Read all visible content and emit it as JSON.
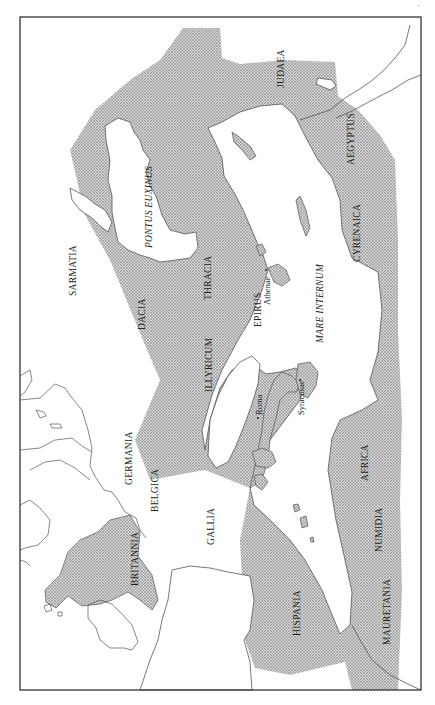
{
  "map": {
    "title": "",
    "orientation": "rotated 90° clockwise (north at left)",
    "colors": {
      "empire_fill": "#bdbdbd",
      "land_outline": "#555555",
      "frame": "#333333",
      "background": "#ffffff"
    },
    "regions": [
      {
        "id": "judaea",
        "label": "JUDAEA",
        "italic": false
      },
      {
        "id": "aegyptus",
        "label": "AEGYPTUS",
        "italic": false
      },
      {
        "id": "cyrenaica",
        "label": "CYRENAICA",
        "italic": false
      },
      {
        "id": "pontus_euxinus",
        "label": "PONTUS EUXINUS",
        "italic": true
      },
      {
        "id": "sarmatia",
        "label": "SARMATIA",
        "italic": false
      },
      {
        "id": "dacia",
        "label": "DACIA",
        "italic": false
      },
      {
        "id": "thracia",
        "label": "THRACIA",
        "italic": false
      },
      {
        "id": "epirus",
        "label": "EPIRUS",
        "italic": false
      },
      {
        "id": "mare_internum",
        "label": "MARE INTERNUM",
        "italic": true
      },
      {
        "id": "illyricum",
        "label": "ILLYRICUM",
        "italic": false
      },
      {
        "id": "germania",
        "label": "GERMANIA",
        "italic": false
      },
      {
        "id": "belgica",
        "label": "BELGICA",
        "italic": false
      },
      {
        "id": "gallia",
        "label": "GALLIA",
        "italic": false
      },
      {
        "id": "britannia",
        "label": "BRITANNIA",
        "italic": false
      },
      {
        "id": "hispania",
        "label": "HISPANIA",
        "italic": false
      },
      {
        "id": "africa",
        "label": "AFRICA",
        "italic": false
      },
      {
        "id": "numidia",
        "label": "NUMIDIA",
        "italic": false
      },
      {
        "id": "mauretania",
        "label": "MAURETANIA",
        "italic": false
      }
    ],
    "cities": [
      {
        "id": "athenae",
        "label": "Athenae"
      },
      {
        "id": "roma",
        "label": "Roma"
      },
      {
        "id": "syracusae",
        "label": "Syracusae"
      }
    ],
    "corner_mark": "'"
  }
}
